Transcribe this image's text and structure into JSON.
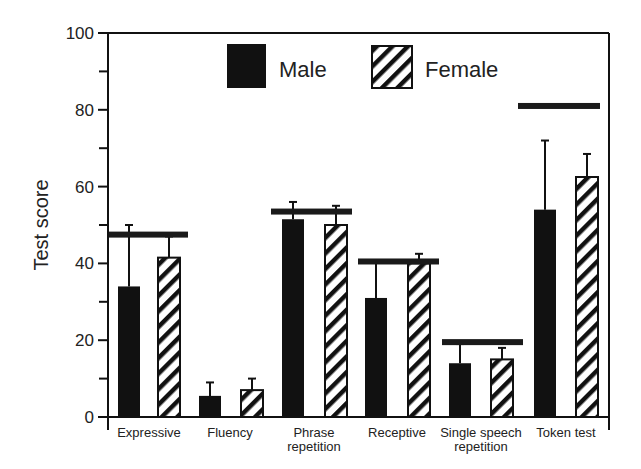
{
  "chart_data": {
    "type": "bar",
    "title": "",
    "xlabel": "",
    "ylabel": "Test score",
    "ylim": [
      0,
      100
    ],
    "yticks": [
      0,
      20,
      40,
      60,
      80,
      100
    ],
    "yminor_ticks": [
      10,
      30,
      50,
      70,
      90
    ],
    "grid": false,
    "legend_position": "top-center inside",
    "categories": [
      "Expressive",
      "Fluency",
      "Phrase repetition",
      "Receptive",
      "Single speech repetition",
      "Token test"
    ],
    "category_label_lines": [
      [
        "Expressive"
      ],
      [
        "Fluency"
      ],
      [
        "Phrase",
        "repetition"
      ],
      [
        "Receptive"
      ],
      [
        "Single speech",
        "repetition"
      ],
      [
        "Token test"
      ]
    ],
    "series": [
      {
        "name": "Male",
        "pattern": "solid-black",
        "values": [
          34,
          5.5,
          51.5,
          31,
          14,
          54
        ],
        "error_upper": [
          50,
          9,
          56,
          40.5,
          19,
          72
        ]
      },
      {
        "name": "Female",
        "pattern": "diagonal-hatch",
        "values": [
          41.5,
          7,
          50,
          40,
          15,
          62.5
        ],
        "error_upper": [
          47,
          10,
          55,
          42.5,
          18,
          68.5
        ]
      }
    ],
    "reference_lines": {
      "description": "Horizontal bar (normative/cutoff score) per category",
      "values": [
        47.5,
        null,
        53.5,
        40.5,
        19.5,
        81
      ]
    },
    "fluency_reference": null
  },
  "legend": {
    "male_label": "Male",
    "female_label": "Female"
  },
  "axis": {
    "y_title": "Test score",
    "tick_labels": [
      "0",
      "20",
      "40",
      "60",
      "80",
      "100"
    ]
  }
}
